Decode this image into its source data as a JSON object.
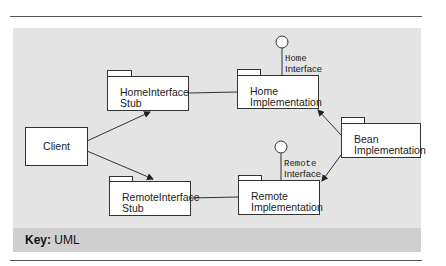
{
  "diagram": {
    "nodes": {
      "client": "Client",
      "home_stub": [
        "HomeInterface",
        "Stub"
      ],
      "home_impl": [
        "Home",
        "Implementation"
      ],
      "remote_stub": [
        "RemoteInterface",
        "Stub"
      ],
      "remote_impl": [
        "Remote",
        "Implementation"
      ],
      "bean_impl": [
        "Bean",
        "Implementation"
      ]
    },
    "interfaces": {
      "home": [
        "Home",
        "Interface"
      ],
      "remote": [
        "Remote",
        "Interface"
      ]
    },
    "edges": [
      {
        "from": "Client",
        "to": "HomeInterface Stub",
        "type": "arrow"
      },
      {
        "from": "Client",
        "to": "RemoteInterface Stub",
        "type": "arrow"
      },
      {
        "from": "HomeInterface Stub",
        "to": "Home Implementation",
        "type": "line"
      },
      {
        "from": "RemoteInterface Stub",
        "to": "Remote Implementation",
        "type": "line"
      },
      {
        "from": "Bean Implementation",
        "to": "Home Implementation",
        "type": "arrow"
      },
      {
        "from": "Bean Implementation",
        "to": "Remote Implementation",
        "type": "arrow"
      }
    ],
    "key_label": "Key:",
    "key_value": "UML"
  }
}
